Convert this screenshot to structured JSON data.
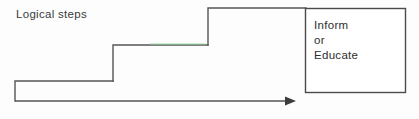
{
  "diagram": {
    "caption_label": "Logical steps",
    "staircase": {
      "description": "three-tier ascending step profile drawn as an open polyline",
      "stroke_color": "#555555",
      "accent_segment_color": "#7cc48a",
      "steps": [
        {
          "name": "lower-step",
          "left": 15,
          "top": 81,
          "right": 113
        },
        {
          "name": "middle-step",
          "left": 113,
          "top": 45,
          "right": 208
        },
        {
          "name": "upper-step",
          "left": 208,
          "top": 8,
          "right": 305
        }
      ]
    },
    "arrow": {
      "name": "progress-arrow",
      "direction": "right",
      "start_x": 15,
      "end_x": 296,
      "y": 101,
      "color": "#555555"
    },
    "box": {
      "name": "outcome-box",
      "left": 305,
      "top": 8,
      "width": 100,
      "height": 84,
      "border_color": "#4a4a4a",
      "fill": "#ffffff",
      "lines": [
        "Inform",
        "or",
        "Educate"
      ]
    }
  },
  "colors": {
    "background": "#fdfdfd",
    "ink": "#555555",
    "text": "#2e2e2e",
    "accent_green": "#7cc48a"
  }
}
